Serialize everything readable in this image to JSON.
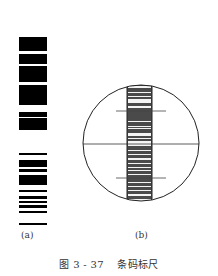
{
  "figure": {
    "caption_number": "图 3 - 37",
    "caption_title": "条码标尺",
    "panels": [
      {
        "id": "a",
        "label": "(a)",
        "description": "barcode staff segment"
      },
      {
        "id": "b",
        "label": "(b)",
        "description": "barcode staff viewed through telescope reticle"
      }
    ]
  },
  "panel_a": {
    "bars": [
      [
        37,
        51
      ],
      [
        54,
        64
      ],
      [
        66,
        82
      ],
      [
        85,
        105
      ],
      [
        112,
        117
      ],
      [
        118,
        130
      ],
      [
        153,
        155
      ],
      [
        160,
        167
      ],
      [
        169,
        172
      ],
      [
        175,
        185
      ],
      [
        190,
        192
      ],
      [
        196,
        199
      ],
      [
        201,
        203
      ],
      [
        205,
        208
      ],
      [
        211,
        213
      ],
      [
        223,
        225
      ]
    ],
    "x": 19,
    "width": 28,
    "color": "#000000"
  },
  "panel_b": {
    "circle": {
      "cx": 141,
      "cy": 143,
      "r": 58,
      "stroke": "#222222"
    },
    "strip": {
      "x": 127,
      "width": 25,
      "y_top": 84,
      "y_bottom": 203,
      "border": "#222222"
    },
    "crosshair": {
      "y": 144,
      "x1": 83,
      "x2": 199
    },
    "stadia_lines": [
      {
        "y": 111,
        "x1": 116,
        "x2": 166
      },
      {
        "y": 178,
        "x1": 116,
        "x2": 166
      }
    ],
    "strip_light_bands": [
      [
        86,
        88
      ],
      [
        92,
        93
      ],
      [
        96,
        97
      ],
      [
        99,
        103
      ],
      [
        106,
        108
      ],
      [
        121,
        122
      ],
      [
        126,
        127
      ],
      [
        128,
        129
      ],
      [
        133,
        136
      ],
      [
        138,
        139
      ],
      [
        141,
        146
      ],
      [
        150,
        151
      ],
      [
        154,
        155
      ],
      [
        158,
        160
      ],
      [
        163,
        164
      ],
      [
        167,
        168
      ],
      [
        170,
        171
      ],
      [
        174,
        175
      ],
      [
        182,
        183
      ],
      [
        186,
        187
      ],
      [
        190,
        191
      ],
      [
        194,
        196
      ],
      [
        199,
        201
      ]
    ],
    "strip_dark_color": "#4a4a4a",
    "strip_light_color": "#f4f4f4"
  }
}
